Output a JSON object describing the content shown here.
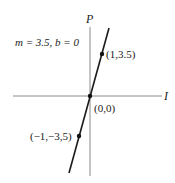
{
  "diagram": {
    "equation_label": "m = 3.5, b = 0",
    "axes": {
      "x_label": "I",
      "y_label": "P"
    },
    "line": {
      "slope": 3.5,
      "intercept": 0
    },
    "points": [
      {
        "label": "(1,3.5)",
        "x": 1,
        "y": 3.5
      },
      {
        "label": "(0,0)",
        "x": 0,
        "y": 0
      },
      {
        "label": "(−1,−3,5)",
        "x": -1,
        "y": -3.5
      }
    ],
    "colors": {
      "axis": "#8a8a8a",
      "line": "#1a1a1a",
      "text": "#222222"
    }
  }
}
